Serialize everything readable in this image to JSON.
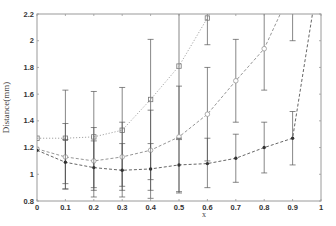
{
  "chart_data": {
    "type": "line",
    "title": "",
    "xlabel": "x",
    "ylabel": "Distance(mm)",
    "xlim": [
      0,
      1
    ],
    "ylim": [
      0.8,
      2.2
    ],
    "xticks": [
      "0",
      "0.1",
      "0.2",
      "0.3",
      "0.4",
      "0.5",
      "0.6",
      "0.7",
      "0.8",
      "0.9",
      "1"
    ],
    "yticks": [
      "0.8",
      "1",
      "1.2",
      "1.4",
      "1.6",
      "1.8",
      "2",
      "2.2"
    ],
    "grid": false,
    "legend": null,
    "series": [
      {
        "name": "series-1 (dotted, square markers)",
        "style": "dotted",
        "marker": "square",
        "color": "#9a9a9a",
        "x": [
          0,
          0.1,
          0.2,
          0.3,
          0.4,
          0.5,
          0.6,
          0.7
        ],
        "y": [
          1.27,
          1.27,
          1.28,
          1.33,
          1.56,
          1.81,
          2.17,
          2.6
        ],
        "err_low": [
          0.02,
          0.38,
          0.4,
          0.45,
          0.6,
          0.55,
          0.2,
          0.3
        ],
        "err_high": [
          0.02,
          0.36,
          0.34,
          0.32,
          0.45,
          0.42,
          0.3,
          0.3
        ]
      },
      {
        "name": "series-2 (dash, open circle markers)",
        "style": "dashed",
        "marker": "circle",
        "color": "#8a8a8a",
        "x": [
          0,
          0.1,
          0.2,
          0.3,
          0.4,
          0.5,
          0.6,
          0.7,
          0.8,
          0.9,
          1.0
        ],
        "y": [
          1.19,
          1.13,
          1.1,
          1.13,
          1.18,
          1.28,
          1.45,
          1.7,
          1.94,
          2.4,
          3.0
        ],
        "err_low": [
          0.02,
          0.2,
          0.2,
          0.22,
          0.3,
          0.42,
          0.35,
          0.31,
          0.31,
          0.4,
          0.4
        ],
        "err_high": [
          0.02,
          0.25,
          0.25,
          0.26,
          0.3,
          0.38,
          0.35,
          0.31,
          0.3,
          0.4,
          0.4
        ]
      },
      {
        "name": "series-3 (dashed, filled dot markers)",
        "style": "dashed",
        "marker": "filled-circle",
        "color": "#555555",
        "x": [
          0,
          0.1,
          0.2,
          0.3,
          0.4,
          0.5,
          0.6,
          0.7,
          0.8,
          0.9,
          1.0
        ],
        "y": [
          1.18,
          1.09,
          1.05,
          1.03,
          1.04,
          1.07,
          1.08,
          1.12,
          1.2,
          1.27,
          2.6
        ],
        "err_low": [
          0.02,
          0.2,
          0.22,
          0.2,
          0.22,
          0.2,
          0.18,
          0.18,
          0.19,
          0.2,
          0.2
        ],
        "err_high": [
          0.02,
          0.17,
          0.2,
          0.2,
          0.19,
          0.2,
          0.19,
          0.18,
          0.19,
          0.2,
          0.2
        ]
      }
    ]
  },
  "layout": {
    "plot": {
      "left": 37,
      "right": 321,
      "top": 14,
      "bottom": 201
    },
    "colors": {
      "axis": "#9a9a9a",
      "errorbar": "#555555",
      "background": "#ffffff"
    }
  }
}
